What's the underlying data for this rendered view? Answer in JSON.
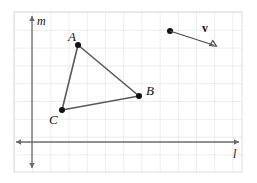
{
  "figure": {
    "width": 257,
    "height": 183,
    "background": "#ffffff",
    "grid": {
      "left": 14,
      "top": 12,
      "right": 242,
      "bottom": 172,
      "spacing_x": 18.2,
      "spacing_y": 17.8,
      "line_color": "#d9dce5",
      "border_color": "#d9dce5",
      "show": true
    },
    "axes": {
      "color": "#6b6b6b",
      "origin": {
        "x": 32,
        "y": 142
      },
      "horizontal": {
        "label": "l",
        "x_start": 14,
        "x_end": 241,
        "y": 142,
        "label_x": 233,
        "label_y": 148
      },
      "vertical": {
        "label": "m",
        "y_start": 14,
        "y_end": 170,
        "x": 32,
        "label_x": 37,
        "label_y": 15
      }
    },
    "triangle": {
      "stroke": "#5a5a5a",
      "point_color": "#111111",
      "point_radius": 3,
      "vertices": [
        {
          "name": "A",
          "x": 78,
          "y": 45,
          "label": "A",
          "label_x": 68,
          "label_y": 30
        },
        {
          "name": "B",
          "x": 139,
          "y": 96,
          "label": "B",
          "label_x": 146,
          "label_y": 84
        },
        {
          "name": "C",
          "x": 62,
          "y": 110,
          "label": "C",
          "label_x": 49,
          "label_y": 113
        }
      ]
    },
    "vector": {
      "label": "v",
      "label_x": 202,
      "label_y": 22,
      "stroke": "#4a4a4a",
      "point_color": "#111111",
      "point_radius": 3,
      "start": {
        "x": 170,
        "y": 31
      },
      "end": {
        "x": 216,
        "y": 46
      }
    }
  }
}
